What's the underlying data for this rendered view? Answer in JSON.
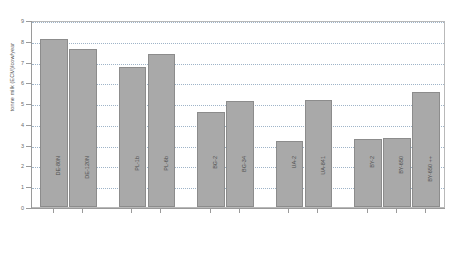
{
  "chart_data": {
    "type": "bar",
    "title": "",
    "subtitle": "",
    "xlabel": "",
    "ylabel": "tonne milk (ECM)/cow/year",
    "ylim": [
      0,
      9
    ],
    "yticks": [
      0,
      1,
      2,
      3,
      4,
      5,
      6,
      7,
      8,
      9
    ],
    "ytick_labels": [
      "0",
      "1",
      "2",
      "3",
      "4",
      "5",
      "6",
      "7",
      "8",
      "9"
    ],
    "grid": true,
    "grid_axis": "y",
    "legend": false,
    "legend_position": "none",
    "categories": [
      "DE-80N",
      "DE-120N",
      "PL-1b",
      "PL-6b",
      "BG-2",
      "BG-34",
      "UA-2",
      "UA-841",
      "BY-2",
      "BY-650",
      "BY-650 ++"
    ],
    "values": [
      8.1,
      7.6,
      6.75,
      7.35,
      4.55,
      5.1,
      3.2,
      5.15,
      3.25,
      3.3,
      5.55
    ],
    "bar_color": "#a9a9a9",
    "bar_edge_color": "#8c8c8c",
    "groups": [
      {
        "label": "DE",
        "members": [
          "DE-80N",
          "DE-120N"
        ]
      },
      {
        "label": "PL",
        "members": [
          "PL-1b",
          "PL-6b"
        ]
      },
      {
        "label": "BG",
        "members": [
          "BG-2",
          "BG-34"
        ]
      },
      {
        "label": "UA",
        "members": [
          "UA-2",
          "UA-841"
        ]
      },
      {
        "label": "BY",
        "members": [
          "BY-2",
          "BY-650",
          "BY-650 ++"
        ]
      }
    ]
  }
}
